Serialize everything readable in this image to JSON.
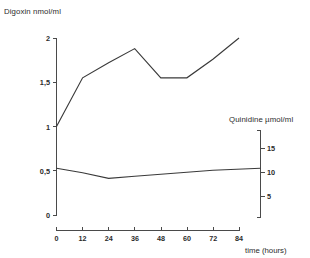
{
  "chart_data": {
    "type": "line",
    "title": "",
    "xlabel": "time (hours)",
    "x": [
      0,
      12,
      24,
      36,
      48,
      60,
      72,
      84
    ],
    "xlim": [
      0,
      84
    ],
    "xticks": [
      "0",
      "12",
      "24",
      "36",
      "48",
      "60",
      "72",
      "84"
    ],
    "grid": false,
    "legend": "none",
    "series": [
      {
        "name": "Digoxin nmol/ml",
        "axis": "left",
        "ylabel": "Digoxin nmol/ml",
        "ylim": [
          0,
          2
        ],
        "yticks": [
          "0",
          "0,5",
          "1",
          "1,5",
          "2"
        ],
        "ytick_values": [
          0,
          0.5,
          1,
          1.5,
          2
        ],
        "values": [
          1.0,
          1.55,
          1.72,
          1.88,
          1.55,
          1.55,
          1.76,
          2.0
        ],
        "color": "#3a3a3a"
      },
      {
        "name": "Quinidine µmol/ml",
        "axis": "right",
        "ylabel": "Quinidine µmol/ml",
        "ylim": [
          0,
          17.5
        ],
        "yticks": [
          "5",
          "10",
          "15"
        ],
        "ytick_values": [
          5,
          10,
          15
        ],
        "values": [
          9.9,
          9.0,
          7.9,
          8.3,
          8.7,
          9.1,
          9.5,
          9.9
        ],
        "color": "#3a3a3a"
      }
    ]
  },
  "labels": {
    "left_axis_title": "Digoxin nmol/ml",
    "right_axis_title": "Quinidine µmol/ml",
    "x_axis_title": "time (hours)",
    "y_left_0": "0",
    "y_left_05": "0,5",
    "y_left_1": "1",
    "y_left_15": "1,5",
    "y_left_2": "2",
    "y_right_5": "5",
    "y_right_10": "10",
    "y_right_15": "15",
    "x_0": "0",
    "x_12": "12",
    "x_24": "24",
    "x_36": "36",
    "x_48": "48",
    "x_60": "60",
    "x_72": "72",
    "x_84": "84"
  },
  "colors": {
    "line": "#3a3a3a",
    "axis": "#4a4a4a",
    "text": "#2b2b2b",
    "background": "#ffffff"
  }
}
